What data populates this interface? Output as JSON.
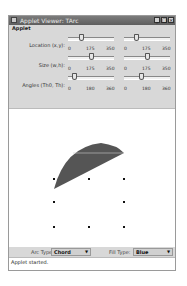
{
  "window": {
    "title": "Applet Viewer: TArc",
    "buttons": {
      "minimize": "_",
      "maximize": "□",
      "close": "×"
    }
  },
  "menubar": {
    "items": [
      {
        "label": "Applet"
      }
    ]
  },
  "controls": {
    "rows": [
      {
        "label": "Location (x,y):",
        "ticks": [
          "0",
          "175",
          "350"
        ],
        "left_value": 100,
        "right_value": 100,
        "max": 350
      },
      {
        "label": "Size (w,h):",
        "ticks": [
          "0",
          "175",
          "350"
        ],
        "left_value": 175,
        "right_value": 175,
        "max": 350
      },
      {
        "label": "Angles (Th0, Th):",
        "ticks": [
          "0",
          "180",
          "360"
        ],
        "left_value": 45,
        "right_value": 135,
        "max": 360
      }
    ]
  },
  "canvas": {
    "shape": "chord",
    "fill_color": "#555555",
    "grid_points": [
      [
        53,
        177
      ],
      [
        88,
        177
      ],
      [
        123,
        177
      ],
      [
        53,
        200
      ],
      [
        123,
        200
      ],
      [
        53,
        225
      ],
      [
        88,
        225
      ],
      [
        123,
        225
      ]
    ]
  },
  "bottom": {
    "arc_type_label": "Arc Type:",
    "arc_type_value": "Chord",
    "fill_type_label": "Fill Type:",
    "fill_type_value": "Blue",
    "arrow": "▼"
  },
  "status": {
    "text": "Applet started."
  }
}
